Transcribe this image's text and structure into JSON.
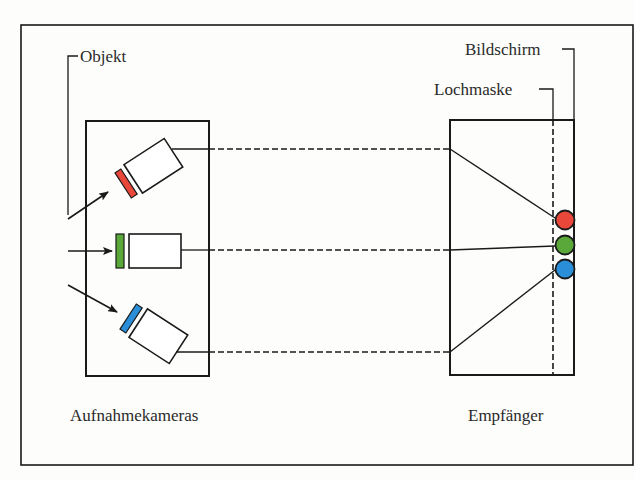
{
  "diagram": {
    "labels": {
      "object": "Objekt",
      "screen": "Bildschirm",
      "shadow_mask": "Lochmaske",
      "cameras": "Aufnahmekameras",
      "receiver": "Empfänger"
    },
    "colors": {
      "red": "#e8473a",
      "green": "#5aa83a",
      "blue": "#2a8fd8",
      "line": "#1a1a1a"
    },
    "cameras": [
      {
        "name": "red-camera",
        "filter_color": "red"
      },
      {
        "name": "green-camera",
        "filter_color": "green"
      },
      {
        "name": "blue-camera",
        "filter_color": "blue"
      }
    ],
    "dots": [
      "red",
      "green",
      "blue"
    ]
  }
}
